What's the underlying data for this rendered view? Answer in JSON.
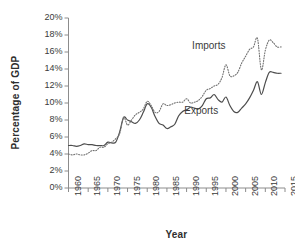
{
  "chart_data": {
    "type": "line",
    "title": "",
    "xlabel": "Year",
    "ylabel": "Percentage of GDP",
    "xlim": [
      1960,
      2015
    ],
    "ylim": [
      0,
      20
    ],
    "grid": false,
    "legend_position": "inline-annotation",
    "xticks": [
      "1960",
      "1965",
      "1970",
      "1975",
      "1980",
      "1985",
      "1990",
      "1995",
      "2000",
      "2005",
      "2010",
      "2015"
    ],
    "xtick_values": [
      1960,
      1965,
      1970,
      1975,
      1980,
      1985,
      1990,
      1995,
      2000,
      2005,
      2010,
      2015
    ],
    "yticks": [
      "0%",
      "2%",
      "4%",
      "6%",
      "8%",
      "10%",
      "12%",
      "14%",
      "16%",
      "18%",
      "20%"
    ],
    "ytick_values": [
      0,
      2,
      4,
      6,
      8,
      10,
      12,
      14,
      16,
      18,
      20
    ],
    "x": [
      1960,
      1961,
      1962,
      1963,
      1964,
      1965,
      1966,
      1967,
      1968,
      1969,
      1970,
      1971,
      1972,
      1973,
      1974,
      1975,
      1976,
      1977,
      1978,
      1979,
      1980,
      1981,
      1982,
      1983,
      1984,
      1985,
      1986,
      1987,
      1988,
      1989,
      1990,
      1991,
      1992,
      1993,
      1994,
      1995,
      1996,
      1997,
      1998,
      1999,
      2000,
      2001,
      2002,
      2003,
      2004,
      2005,
      2006,
      2007,
      2008,
      2009,
      2010,
      2011,
      2012,
      2013,
      2014
    ],
    "series": [
      {
        "name": "Exports",
        "style": "solid",
        "color": "#4d4d4d",
        "values": [
          5.0,
          5.0,
          4.9,
          5.0,
          5.2,
          5.1,
          5.1,
          5.0,
          5.0,
          5.0,
          5.4,
          5.3,
          5.4,
          6.6,
          8.3,
          8.0,
          7.8,
          7.6,
          8.0,
          8.9,
          9.9,
          9.5,
          8.4,
          7.6,
          7.4,
          7.0,
          7.2,
          7.5,
          8.5,
          9.0,
          9.2,
          9.5,
          9.4,
          9.3,
          9.7,
          10.5,
          10.6,
          11.0,
          10.4,
          10.1,
          10.7,
          9.7,
          9.0,
          8.9,
          9.4,
          9.9,
          10.6,
          11.5,
          12.5,
          11.0,
          12.4,
          13.6,
          13.6,
          13.5,
          13.5
        ]
      },
      {
        "name": "Imports",
        "style": "dotted",
        "color": "#707070",
        "values": [
          4.0,
          3.9,
          4.0,
          3.9,
          3.9,
          4.1,
          4.4,
          4.4,
          4.8,
          4.8,
          5.2,
          5.4,
          5.8,
          6.4,
          8.3,
          7.4,
          8.0,
          8.6,
          8.9,
          9.3,
          10.2,
          9.7,
          8.9,
          9.0,
          9.9,
          9.7,
          9.8,
          10.0,
          10.1,
          10.1,
          10.5,
          10.0,
          10.1,
          10.3,
          10.8,
          11.5,
          11.7,
          12.0,
          12.2,
          13.0,
          14.5,
          13.2,
          13.2,
          13.6,
          14.7,
          15.5,
          16.3,
          16.6,
          17.6,
          13.9,
          16.2,
          17.4,
          17.1,
          16.6,
          16.6
        ]
      }
    ],
    "annotations": [
      {
        "text": "Imports",
        "x": 1997.5,
        "y": 16.6
      },
      {
        "text": "Exports",
        "x": 1995.5,
        "y": 9.0
      }
    ]
  }
}
